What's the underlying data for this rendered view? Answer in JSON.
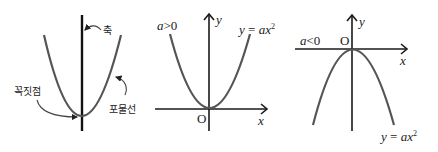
{
  "diagram": {
    "panels": [
      {
        "id": "parabola-anatomy",
        "labels": {
          "axis": "축",
          "vertex": "꼭짓점",
          "parabola": "포물선"
        }
      },
      {
        "id": "upward-parabola",
        "condition": "a > 0",
        "condition_var": "a",
        "condition_op": ">",
        "condition_val": "0",
        "equation_lhs": "y",
        "equation_eq": " = ",
        "equation_rhs": "ax",
        "equation_exp": "2",
        "x_label": "x",
        "y_label": "y",
        "origin_label": "O"
      },
      {
        "id": "downward-parabola",
        "condition": "a < 0",
        "condition_var": "a",
        "condition_op": "<",
        "condition_val": "0",
        "equation_lhs": "y",
        "equation_eq": " = ",
        "equation_rhs": "ax",
        "equation_exp": "2",
        "x_label": "x",
        "y_label": "y",
        "origin_label": "O"
      }
    ]
  }
}
